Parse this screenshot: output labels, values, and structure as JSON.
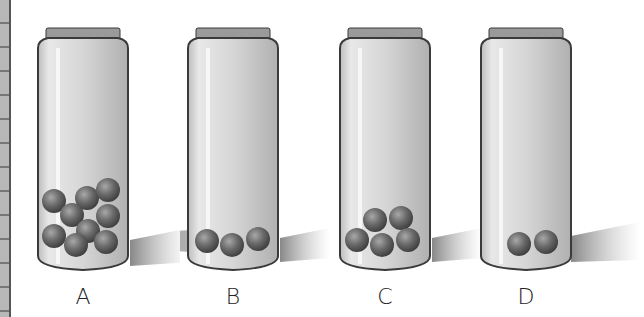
{
  "figure": {
    "jars": [
      {
        "label": "A",
        "marble_count": 9
      },
      {
        "label": "B",
        "marble_count": 3
      },
      {
        "label": "C",
        "marble_count": 5
      },
      {
        "label": "D",
        "marble_count": 2
      }
    ]
  },
  "colors": {
    "jar_fill": "#d9d9d9",
    "jar_outline": "#3a3a3a",
    "marble": "#5a5a5a",
    "shadow": "#8c8c8c"
  }
}
